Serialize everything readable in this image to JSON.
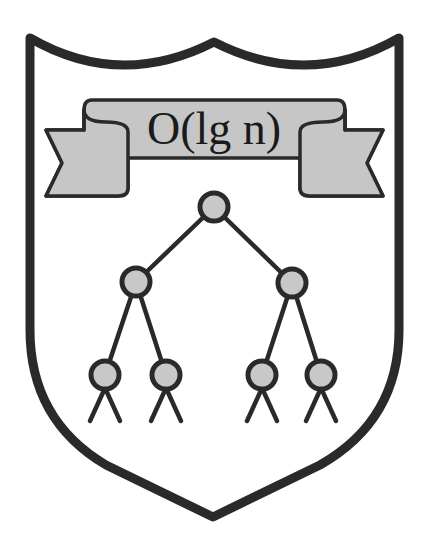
{
  "figure": {
    "type": "crest",
    "colors": {
      "outline": "#2a2a2a",
      "ribbon_fill": "#c6c6c6",
      "node_fill": "#c8c8c8",
      "background": "#ffffff"
    }
  },
  "banner": {
    "motto": "O(lg n)"
  },
  "tree": {
    "levels": 3,
    "nodes": [
      {
        "id": "root",
        "level": 0
      },
      {
        "id": "left",
        "level": 1
      },
      {
        "id": "right",
        "level": 1
      },
      {
        "id": "left-left",
        "level": 2
      },
      {
        "id": "left-right",
        "level": 2
      },
      {
        "id": "right-left",
        "level": 2
      },
      {
        "id": "right-right",
        "level": 2
      }
    ]
  }
}
